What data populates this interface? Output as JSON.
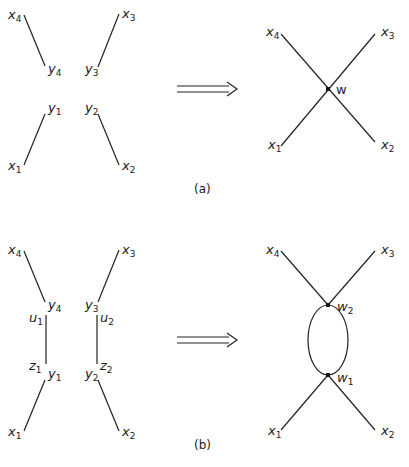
{
  "panel_a": {
    "caption": "(a)",
    "left": {
      "labels": {
        "x4": "x",
        "x4_sub": "4",
        "x3": "x",
        "x3_sub": "3",
        "y4": "y",
        "y4_sub": "4",
        "y3": "y",
        "y3_sub": "3",
        "y1": "y",
        "y1_sub": "1",
        "y2": "y",
        "y2_sub": "2",
        "x1": "x",
        "x1_sub": "1",
        "x2": "x",
        "x2_sub": "2"
      }
    },
    "right": {
      "labels": {
        "x4": "x",
        "x4_sub": "4",
        "x3": "x",
        "x3_sub": "3",
        "x1": "x",
        "x1_sub": "1",
        "x2": "x",
        "x2_sub": "2",
        "w": "w"
      }
    }
  },
  "panel_b": {
    "caption": "(b)",
    "left": {
      "labels": {
        "x4": "x",
        "x4_sub": "4",
        "x3": "x",
        "x3_sub": "3",
        "y4": "y",
        "y4_sub": "4",
        "y3": "y",
        "y3_sub": "3",
        "u1": "u",
        "u1_sub": "1",
        "u2": "u",
        "u2_sub": "2",
        "z1": "z",
        "z1_sub": "1",
        "z2": "z",
        "z2_sub": "2",
        "y1": "y",
        "y1_sub": "1",
        "y2": "y",
        "y2_sub": "2",
        "x1": "x",
        "x1_sub": "1",
        "x2": "x",
        "x2_sub": "2"
      }
    },
    "right": {
      "labels": {
        "x4": "x",
        "x4_sub": "4",
        "x3": "x",
        "x3_sub": "3",
        "x1": "x",
        "x1_sub": "1",
        "x2": "x",
        "x2_sub": "2",
        "w2": "w",
        "w2_sub": "2",
        "w1": "w",
        "w1_sub": "1"
      }
    }
  }
}
